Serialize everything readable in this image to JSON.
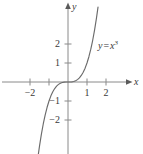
{
  "chart_data": {
    "type": "line",
    "title": "",
    "subtitle": "",
    "xlabel": "x",
    "ylabel": "y",
    "xlim": [
      -2.6,
      3.45
    ],
    "ylim": [
      -3.8,
      4.1
    ],
    "grid": false,
    "legend": "none",
    "annotations": [
      {
        "name": "curve-equation",
        "text_lhs": "y",
        "text_op": "=",
        "text_base": "x",
        "text_exponent": "3",
        "text_full": "y = x³",
        "x_data": 1.75,
        "y_data": 2.45
      }
    ],
    "axes": {
      "x_axis_arrow": true,
      "y_axis_arrow": true,
      "x_ticks": [
        -2,
        -1,
        1,
        2
      ],
      "x_tick_labels": [
        "−2",
        "",
        "1",
        "2"
      ],
      "y_ticks": [
        -2,
        -1,
        1,
        2
      ],
      "y_tick_labels": [
        "−2",
        "−1",
        "1",
        "2"
      ]
    },
    "series": [
      {
        "name": "y = x^3",
        "color": "#6b6b6b",
        "x": [
          -1.58,
          -1.5,
          -1.4,
          -1.3,
          -1.2,
          -1.1,
          -1.0,
          -0.9,
          -0.8,
          -0.7,
          -0.6,
          -0.5,
          -0.4,
          -0.3,
          -0.2,
          -0.1,
          0.0,
          0.1,
          0.2,
          0.3,
          0.4,
          0.5,
          0.6,
          0.7,
          0.8,
          0.9,
          1.0,
          1.1,
          1.2,
          1.3,
          1.4,
          1.5,
          1.58
        ],
        "y": [
          -3.94,
          -3.375,
          -2.744,
          -2.197,
          -1.728,
          -1.331,
          -1.0,
          -0.729,
          -0.512,
          -0.343,
          -0.216,
          -0.125,
          -0.064,
          -0.027,
          -0.008,
          -0.001,
          0.0,
          0.001,
          0.008,
          0.027,
          0.064,
          0.125,
          0.216,
          0.343,
          0.512,
          0.729,
          1.0,
          1.331,
          1.728,
          2.197,
          2.744,
          3.375,
          3.94
        ]
      }
    ]
  },
  "colors": {
    "axis": "#8a8a8a",
    "curve": "#6b6b6b",
    "text": "#3a3a3a",
    "background": "#ffffff"
  }
}
